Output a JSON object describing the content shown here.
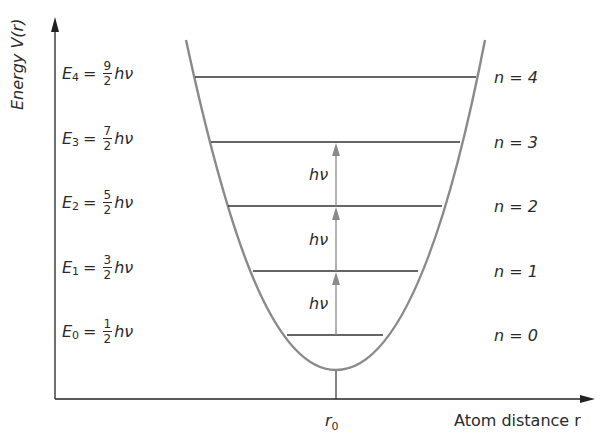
{
  "diagram": {
    "title": "",
    "y_axis": {
      "label": "Energy V(r)"
    },
    "x_axis": {
      "label": "Atom distance r",
      "tick_label": "r",
      "tick_subscript": "0"
    },
    "curve": {
      "type": "parabola",
      "description": "Harmonic oscillator potential",
      "color": "#8a8a8a"
    },
    "levels": [
      {
        "n": 4,
        "symbol": "E",
        "subscript": "4",
        "num": "9",
        "den": "2",
        "unit": "hν",
        "quantum_label": "n = 4",
        "y": 77,
        "x1": 195,
        "x2": 476
      },
      {
        "n": 3,
        "symbol": "E",
        "subscript": "3",
        "num": "7",
        "den": "2",
        "unit": "hν",
        "quantum_label": "n = 3",
        "y": 142,
        "x1": 211,
        "x2": 460
      },
      {
        "n": 2,
        "symbol": "E",
        "subscript": "2",
        "num": "5",
        "den": "2",
        "unit": "hν",
        "quantum_label": "n = 2",
        "y": 206,
        "x1": 228,
        "x2": 442
      },
      {
        "n": 1,
        "symbol": "E",
        "subscript": "1",
        "num": "3",
        "den": "2",
        "unit": "hν",
        "quantum_label": "n = 1",
        "y": 271,
        "x1": 253,
        "x2": 418
      },
      {
        "n": 0,
        "symbol": "E",
        "subscript": "0",
        "num": "1",
        "den": "2",
        "unit": "hν",
        "quantum_label": "n = 0",
        "y": 335,
        "x1": 287,
        "x2": 383
      }
    ],
    "transitions": [
      {
        "from": 0,
        "to": 1,
        "label": "hν"
      },
      {
        "from": 1,
        "to": 2,
        "label": "hν"
      },
      {
        "from": 2,
        "to": 3,
        "label": "hν"
      }
    ],
    "equals": "="
  }
}
